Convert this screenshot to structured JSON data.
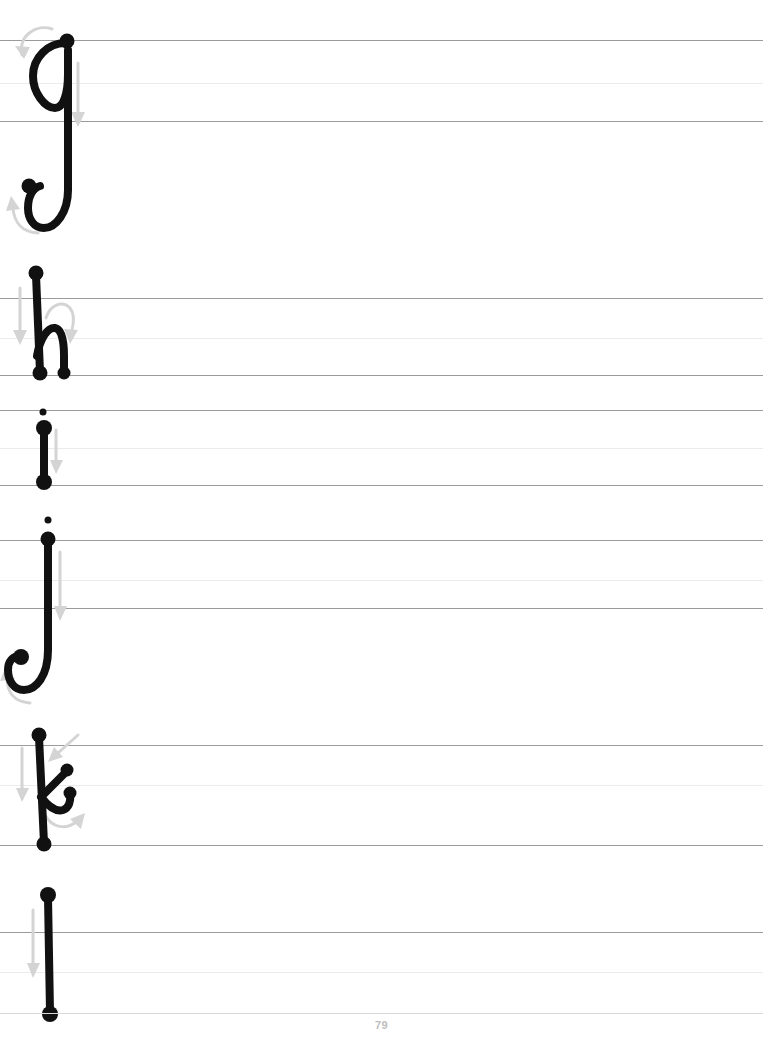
{
  "page": {
    "kind": "handwriting-practice-worksheet",
    "page_number": "79",
    "background_color": "#ffffff",
    "ink_color": "#111111",
    "guide_arrow_color": "#d4d4d4",
    "rule_dark_color": "#9b9b9b",
    "rule_light_color": "#ebebeb",
    "footer_rule_color": "#d9d9d9"
  },
  "rule_groups": [
    {
      "name": "group-1",
      "top": 40,
      "middle": 83,
      "baseline": 121
    },
    {
      "name": "group-2",
      "top": 298,
      "middle": 338,
      "baseline": 375
    },
    {
      "name": "group-3",
      "top": 410,
      "middle": 448,
      "baseline": 485
    },
    {
      "name": "group-4",
      "top": 540,
      "middle": 580,
      "baseline": 608
    },
    {
      "name": "group-5",
      "top": 745,
      "middle": 785,
      "baseline": 845
    },
    {
      "name": "group-6",
      "top": 932,
      "middle": 972,
      "baseline": 1013
    }
  ],
  "letters": [
    {
      "id": "letter-g",
      "character": "g",
      "label": "lowercase-g",
      "stroke_count": 1,
      "has_descender": true,
      "start_dots": [
        [
          67,
          41
        ]
      ],
      "end_dots": [
        [
          28,
          186
        ]
      ],
      "arrow_hints": [
        "curve-over-top-leftward",
        "straight-down",
        "hook-up-left"
      ]
    },
    {
      "id": "letter-h",
      "character": "h",
      "label": "lowercase-h",
      "stroke_count": 2,
      "has_ascender": true,
      "start_dots": [
        [
          36,
          273
        ],
        [
          36,
          373
        ]
      ],
      "end_dots": [
        [
          40,
          374
        ],
        [
          64,
          374
        ]
      ],
      "arrow_hints": [
        "straight-down",
        "arch-over-right"
      ]
    },
    {
      "id": "letter-i",
      "character": "i",
      "label": "lowercase-i",
      "stroke_count": 2,
      "has_dot": true,
      "start_dots": [
        [
          43,
          413
        ],
        [
          44,
          427
        ]
      ],
      "end_dots": [
        [
          44,
          482
        ]
      ],
      "arrow_hints": [
        "dot",
        "straight-down"
      ]
    },
    {
      "id": "letter-j",
      "character": "j",
      "label": "lowercase-j",
      "stroke_count": 2,
      "has_dot": true,
      "has_descender": true,
      "start_dots": [
        [
          48,
          521
        ],
        [
          48,
          539
        ]
      ],
      "end_dots": [
        [
          22,
          658
        ]
      ],
      "arrow_hints": [
        "dot",
        "straight-down",
        "hook-up-left"
      ]
    },
    {
      "id": "letter-k",
      "character": "k",
      "label": "lowercase-k",
      "stroke_count": 2,
      "has_ascender": true,
      "start_dots": [
        [
          39,
          735
        ],
        [
          67,
          770
        ],
        [
          70,
          793
        ]
      ],
      "end_dots": [
        [
          44,
          844
        ]
      ],
      "arrow_hints": [
        "straight-down",
        "diagonal-in-down-left",
        "curve-out-right"
      ]
    },
    {
      "id": "letter-l",
      "character": "l",
      "label": "lowercase-l",
      "stroke_count": 1,
      "has_ascender": true,
      "start_dots": [
        [
          48,
          895
        ]
      ],
      "end_dots": [
        [
          50,
          1014
        ]
      ],
      "arrow_hints": [
        "straight-down"
      ]
    }
  ]
}
